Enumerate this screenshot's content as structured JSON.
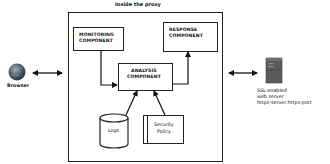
{
  "diagram": {
    "proxy": {
      "title": "Inside the proxy"
    },
    "components": {
      "monitoring": {
        "line1": "MONITORING",
        "line2": "COMPONENT"
      },
      "response": {
        "line1": "RESPONSE",
        "line2": "COMPONENT"
      },
      "analysis": {
        "line1": "ANALYSIS",
        "line2": "COMPONENT"
      }
    },
    "stores": {
      "logs": {
        "label": "Logs"
      },
      "security_policy": {
        "line1": "Security",
        "line2": "Policy"
      }
    },
    "browser": {
      "label": "Browser",
      "icon": "globe-icon"
    },
    "server": {
      "icon": "server-tower-icon",
      "line1": "SSL-enabled",
      "line2": "web server",
      "line3": "https-server:https-port"
    },
    "colors": {
      "stroke": "#222222",
      "server": "#555555",
      "globe": "#4a5a6a"
    }
  }
}
